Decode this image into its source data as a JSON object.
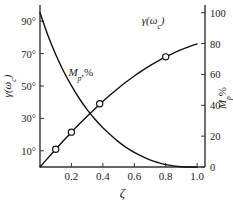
{
  "chart_data": {
    "type": "line",
    "title": "",
    "xlabel": "ζ",
    "ylabel": "γ(ωc)",
    "ylabel_right": "Mp%",
    "xlim": [
      0.0,
      1.05
    ],
    "ylim_left": [
      0,
      100
    ],
    "ylim_right": [
      0,
      105
    ],
    "grid": false,
    "legend": "inline-curve-labels",
    "x_ticks": [
      "0.2",
      "0.4",
      "0.6",
      "0.8",
      "1.0"
    ],
    "x_tick_values": [
      0.2,
      0.4,
      0.6,
      0.8,
      1.0
    ],
    "y_left_ticks": [
      "10°",
      "30°",
      "50°",
      "70°",
      "90°"
    ],
    "y_left_tick_values": [
      10,
      30,
      50,
      70,
      90
    ],
    "y_right_ticks": [
      "0",
      "20",
      "40",
      "60",
      "80",
      "100"
    ],
    "y_right_tick_values": [
      0,
      20,
      40,
      60,
      80,
      100
    ],
    "series": [
      {
        "name": "γ(ωc)",
        "axis": "left",
        "units": "degrees",
        "label_text": "γ(ωc)",
        "markers": true,
        "x": [
          0.0,
          0.05,
          0.1,
          0.15,
          0.2,
          0.25,
          0.3,
          0.35,
          0.4,
          0.45,
          0.5,
          0.55,
          0.6,
          0.65,
          0.7,
          0.75,
          0.8,
          0.85,
          0.9,
          0.95,
          1.0
        ],
        "values": [
          0,
          5.5,
          11,
          16.3,
          21.5,
          26.5,
          31.3,
          36.0,
          40.5,
          44.7,
          48.8,
          52.6,
          56.2,
          59.5,
          62.6,
          65.4,
          68.0,
          70.3,
          72.4,
          74.3,
          76.0
        ],
        "data_points": [
          {
            "x": 0.1,
            "y": 11
          },
          {
            "x": 0.2,
            "y": 21.5
          },
          {
            "x": 0.38,
            "y": 39.0
          },
          {
            "x": 0.8,
            "y": 68.0
          }
        ]
      },
      {
        "name": "Mp%",
        "axis": "right",
        "units": "percent",
        "label_text": "Mp,%",
        "markers": false,
        "x": [
          0.0,
          0.05,
          0.1,
          0.15,
          0.2,
          0.25,
          0.3,
          0.35,
          0.4,
          0.45,
          0.5,
          0.55,
          0.6,
          0.65,
          0.7,
          0.75,
          0.8,
          0.85,
          0.9,
          0.95,
          1.0
        ],
        "values": [
          100,
          85.4,
          72.9,
          62.1,
          52.7,
          44.4,
          37.2,
          30.9,
          25.4,
          20.7,
          16.3,
          12.6,
          9.5,
          6.9,
          4.6,
          2.9,
          1.5,
          0.7,
          0.2,
          0.02,
          0.0
        ]
      }
    ],
    "annotations": [
      {
        "name": "mp-curve-label",
        "text": "Mp,%",
        "x": 0.26,
        "y_left": 56
      },
      {
        "name": "gamma-curve-label",
        "text": "γ(ωc)",
        "x": 0.72,
        "y_left": 88
      }
    ]
  },
  "axes": {
    "x_axis_label": "ζ",
    "y_left_axis_label": "γ(ωc)",
    "y_right_axis_label": "Mp%"
  },
  "colors": {
    "curve": "#111111",
    "axis": "#333333",
    "text": "#1a1a1a",
    "background": "#ffffff",
    "marker_fill": "#ffffff"
  }
}
